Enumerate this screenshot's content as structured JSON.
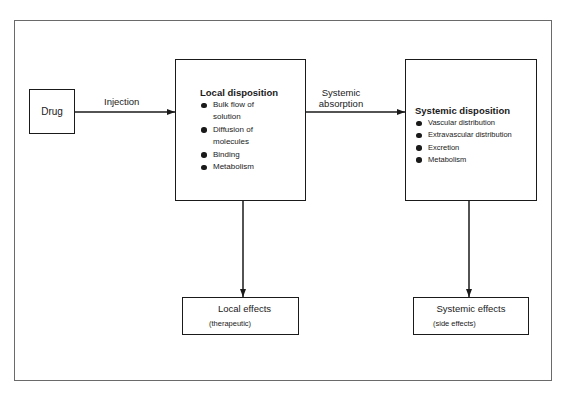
{
  "diagram": {
    "nodes": {
      "drug": {
        "label": "Drug"
      },
      "local_disposition": {
        "title": "Local disposition",
        "items": [
          "Bulk flow of",
          "solution",
          "Diffusion of",
          "molecules",
          "Binding",
          "Metabolism"
        ],
        "bullets": [
          "Bulk flow of solution",
          "Diffusion of molecules",
          "Binding",
          "Metabolism"
        ]
      },
      "systemic_disposition": {
        "title": "Systemic disposition",
        "bullets": [
          "Vascular distribution",
          "Extravascular distribution",
          "Excretion",
          "Metabolism"
        ]
      },
      "local_effects": {
        "title": "Local effects",
        "subtitle": "(therapeutic)"
      },
      "systemic_effects": {
        "title": "Systemic effects",
        "subtitle": "(side effects)"
      }
    },
    "edges": {
      "injection": {
        "from": "drug",
        "to": "local_disposition",
        "label": "Injection"
      },
      "systemic_absorption": {
        "from": "local_disposition",
        "to": "systemic_disposition",
        "label_line1": "Systemic",
        "label_line2": "absorption"
      },
      "local_to_effects": {
        "from": "local_disposition",
        "to": "local_effects"
      },
      "systemic_to_effects": {
        "from": "systemic_disposition",
        "to": "systemic_effects"
      }
    }
  }
}
